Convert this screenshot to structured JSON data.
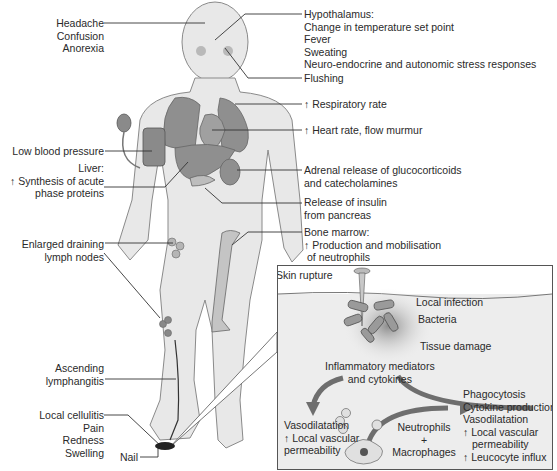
{
  "figure": {
    "left_labels": [
      {
        "id": "headache",
        "lines": [
          "Headache",
          "Confusion",
          "Anorexia"
        ]
      },
      {
        "id": "low-bp",
        "lines": [
          "Low blood pressure"
        ]
      },
      {
        "id": "liver",
        "lines": [
          "Liver:",
          "↑ Synthesis of acute",
          "phase proteins"
        ]
      },
      {
        "id": "lymph-nodes",
        "lines": [
          "Enlarged draining",
          "lymph nodes"
        ]
      },
      {
        "id": "lymphangitis",
        "lines": [
          "Ascending",
          "lymphangitis"
        ]
      },
      {
        "id": "cellulitis",
        "lines": [
          "Local cellulitis",
          "Pain",
          "Redness",
          "Swelling"
        ]
      },
      {
        "id": "nail",
        "lines": [
          "Nail"
        ]
      }
    ],
    "right_labels": [
      {
        "id": "hypothalamus",
        "lines": [
          "Hypothalamus:",
          "Change in temperature set point",
          "Fever",
          "Sweating",
          "Neuro-endocrine and autonomic stress responses"
        ]
      },
      {
        "id": "flushing",
        "lines": [
          "Flushing"
        ]
      },
      {
        "id": "respiratory",
        "lines": [
          "↑ Respiratory rate"
        ]
      },
      {
        "id": "heart",
        "lines": [
          "↑ Heart rate, flow murmur"
        ]
      },
      {
        "id": "adrenal",
        "lines": [
          "Adrenal release of glucocorticoids",
          "and catecholamines"
        ]
      },
      {
        "id": "insulin",
        "lines": [
          "Release of insulin",
          "from pancreas"
        ]
      },
      {
        "id": "bone-marrow",
        "lines": [
          "Bone marrow:",
          "↑ Production and mobilisation",
          "of neutrophils"
        ]
      }
    ],
    "inset": {
      "skin_rupture": "Skin rupture",
      "local_infection": "Local infection",
      "bacteria": "Bacteria",
      "tissue_damage": "Tissue damage",
      "mediators": [
        "Inflammatory mediators",
        "and cytokines"
      ],
      "left_effects": [
        "Vasodilatation",
        "↑ Local vascular",
        "permeability"
      ],
      "cells": [
        "Neutrophils",
        "+",
        "Macrophages"
      ],
      "right_effects": [
        "Phagocytosis",
        "Cytokine production",
        "Vasodilatation",
        "↑ Local vascular",
        "permeability",
        "↑ Leucocyte influx"
      ]
    },
    "colors": {
      "organ": "#8a8a8a",
      "skin": "#e6e6e6",
      "outline": "#777777",
      "line": "#333333",
      "inset_bg": "#ededed"
    }
  }
}
